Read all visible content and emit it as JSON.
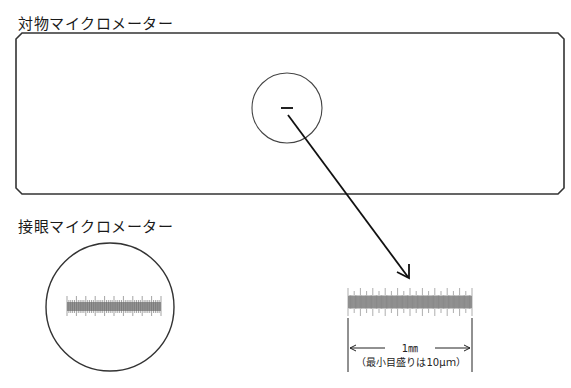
{
  "objective_micrometer": {
    "label": "対物マイクロメーター"
  },
  "eyepiece_micrometer": {
    "label": "接眼マイクロメーター"
  },
  "scale_annotation": {
    "length_label": "1㎜",
    "min_division_note": "（最小目盛りは10μｍ）"
  },
  "colors": {
    "stroke": "#333333",
    "scale_fill": "#9a9a9a"
  }
}
